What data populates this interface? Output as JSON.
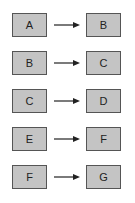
{
  "diagram": {
    "rows": [
      {
        "from": "A",
        "to": "B"
      },
      {
        "from": "B",
        "to": "C"
      },
      {
        "from": "C",
        "to": "D"
      },
      {
        "from": "E",
        "to": "F"
      },
      {
        "from": "F",
        "to": "G"
      }
    ],
    "colors": {
      "box_fill": "#c4c4c4",
      "box_border": "#555555",
      "arrow": "#222222"
    }
  }
}
